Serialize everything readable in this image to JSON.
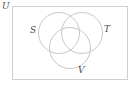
{
  "figure": {
    "kind": "venn-diagram",
    "sets_count": 3,
    "background_color": "#ffffff",
    "universe": {
      "label": "U",
      "shape": "rectangle",
      "stroke_color": "#d0d0d0",
      "stroke_width": 1,
      "x": 12,
      "y": 6,
      "width": 115,
      "height": 73,
      "label_position": "outside-top-left"
    },
    "stroke_color": "#c8c8c8",
    "stroke_width": 1,
    "label_color": "#4a4a4a",
    "circles": [
      {
        "label": "S",
        "cx": 59,
        "cy": 33,
        "r": 20.5,
        "label_position": "left-outside"
      },
      {
        "label": "T",
        "cx": 82,
        "cy": 33,
        "r": 20.5,
        "label_position": "right-outside"
      },
      {
        "label": "V",
        "cx": 70,
        "cy": 48,
        "r": 20.5,
        "label_position": "bottom-outside"
      }
    ],
    "labels": [
      {
        "name": "universe-label",
        "text": "U"
      },
      {
        "name": "set-label-s",
        "text": "S"
      },
      {
        "name": "set-label-t",
        "text": "T"
      },
      {
        "name": "set-label-v",
        "text": "V"
      }
    ]
  }
}
